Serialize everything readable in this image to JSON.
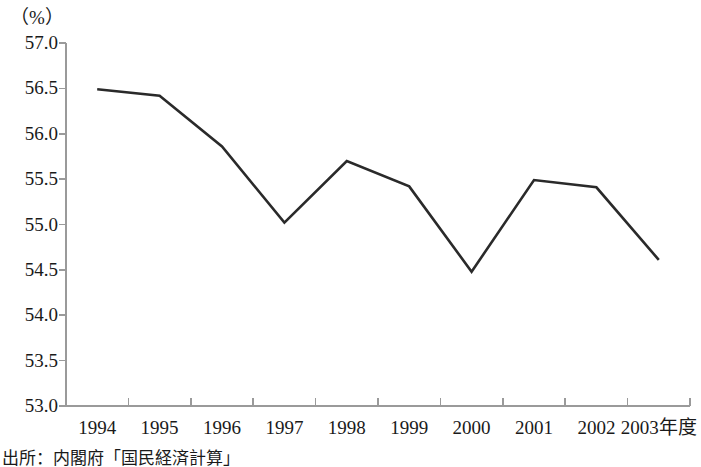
{
  "unit_label": "（%）",
  "source_note": "出所：内閣府「国民経済計算」",
  "axis": {
    "y_ticks": [
      "57.0",
      "56.5",
      "56.0",
      "55.5",
      "55.0",
      "54.5",
      "54.0",
      "53.5",
      "53.0"
    ],
    "x_ticks": [
      "1994",
      "1995",
      "1996",
      "1997",
      "1998",
      "1999",
      "2000",
      "2001",
      "2002",
      "2003年度"
    ]
  },
  "style": {
    "line_color": "#2a2a2a",
    "axis_color": "#9a9a9a",
    "text_color": "#1a1a1a",
    "background": "#ffffff"
  },
  "chart_data": {
    "type": "line",
    "title": "",
    "subtitle": "",
    "xlabel": "年度",
    "ylabel": "（%）",
    "categories": [
      "1994",
      "1995",
      "1996",
      "1997",
      "1998",
      "1999",
      "2000",
      "2001",
      "2002",
      "2003"
    ],
    "tick_labels": [
      "1994",
      "1995",
      "1996",
      "1997",
      "1998",
      "1999",
      "2000",
      "2001",
      "2002",
      "2003年度"
    ],
    "values": [
      56.49,
      56.42,
      55.86,
      55.02,
      55.7,
      55.42,
      54.48,
      55.49,
      55.41,
      54.61
    ],
    "ylim": [
      53.0,
      57.0
    ],
    "ytick_values": [
      57.0,
      56.5,
      56.0,
      55.5,
      55.0,
      54.5,
      54.0,
      53.5,
      53.0
    ],
    "ytick_step": 0.5,
    "grid": false,
    "legend": null,
    "series": [
      {
        "name": "",
        "values": [
          56.49,
          56.42,
          55.86,
          55.02,
          55.7,
          55.42,
          54.48,
          55.49,
          55.41,
          54.61
        ]
      }
    ],
    "annotations": [
      "出所：内閣府「国民経済計算」"
    ]
  }
}
